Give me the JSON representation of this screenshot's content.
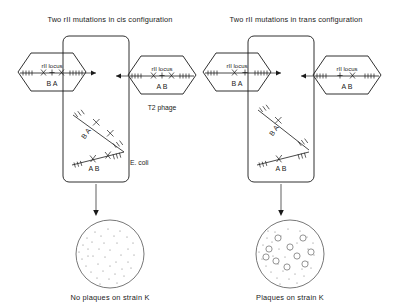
{
  "figure": {
    "type": "genetics-complementation-diagram",
    "panels": [
      {
        "id": "cis",
        "title": "Two rII mutations in cis configuration",
        "phages": [
          {
            "position": "left",
            "locus_label": "rII locus",
            "markers": "x + x",
            "alleles": "B A",
            "name": ""
          },
          {
            "position": "right",
            "locus_label": "rII locus",
            "markers": "x + x",
            "alleles": "A B",
            "name": "T2 phage"
          }
        ],
        "cell": {
          "label": "E. coli",
          "chromosomes": [
            {
              "alleles": "B A",
              "mutations": 2
            },
            {
              "alleles": "A B",
              "mutations": 2
            }
          ]
        },
        "plate": {
          "caption": "No plaques on strain K",
          "plaques": 0
        }
      },
      {
        "id": "trans",
        "title": "Two rII mutations in trans configuration",
        "phages": [
          {
            "position": "left",
            "locus_label": "rII locus",
            "markers": "x +",
            "alleles": "B A",
            "name": ""
          },
          {
            "position": "right",
            "locus_label": "rII locus",
            "markers": "+ x",
            "alleles": "A B",
            "name": ""
          }
        ],
        "cell": {
          "label": "",
          "chromosomes": [
            {
              "alleles": "B A",
              "mutations": 1
            },
            {
              "alleles": "A B",
              "mutations": 1
            }
          ]
        },
        "plate": {
          "caption": "Plaques on strain K",
          "plaques": 10
        }
      }
    ],
    "locus_label": "rII locus",
    "phage_name": "T2 phage",
    "host_name": "E. coli",
    "colors": {
      "ink": "#1a1a1a",
      "plate_outline": "#555555",
      "stipple": "#777777"
    }
  }
}
